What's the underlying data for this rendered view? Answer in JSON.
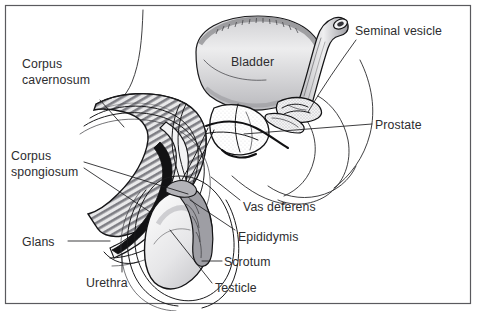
{
  "figure": {
    "type": "anatomical-illustration",
    "background_color": "#ffffff",
    "ink_color": "#1a1a1c",
    "frame_color": "#5a5a5e",
    "label_color": "#2d2d2f"
  },
  "labels": [
    {
      "id": "corpus-cavernosum",
      "line1": "Corpus",
      "line2": "cavernosum",
      "x": 22,
      "y": 68,
      "align": "start",
      "leader": "M100,100 L124,127"
    },
    {
      "id": "corpus-spongiosum",
      "line1": "Corpus",
      "line2": "spongiosum",
      "x": 11,
      "y": 150,
      "align": "start",
      "leader": "M84,164 L186,196"
    },
    {
      "id": "glans",
      "line1": "Glans",
      "line2": "",
      "x": 22,
      "y": 236,
      "align": "start",
      "leader": "M68,241 L108,241"
    },
    {
      "id": "urethra",
      "line1": "Urethra",
      "line2": "",
      "x": 86,
      "y": 276,
      "align": "start",
      "leader": "M122,272 L122,256"
    },
    {
      "id": "bladder",
      "line1": "Bladder",
      "line2": "",
      "x": 231,
      "y": 57,
      "align": "start",
      "leader": ""
    },
    {
      "id": "seminal-vesicle",
      "line1": "Seminal vesicle",
      "line2": "",
      "x": 355,
      "y": 25,
      "align": "start",
      "leader": "M356,40 L308,110"
    },
    {
      "id": "prostate",
      "line1": "Prostate",
      "line2": "",
      "x": 375,
      "y": 118,
      "align": "start",
      "leader": "M372,124 L244,133"
    },
    {
      "id": "vas-deferens",
      "line1": "Vas deferens",
      "line2": "",
      "x": 243,
      "y": 201,
      "align": "start",
      "leader": "M240,200 L211,177"
    },
    {
      "id": "epididymis",
      "line1": "Epididymis",
      "line2": "",
      "x": 238,
      "y": 231,
      "align": "start",
      "leader": "M235,230 L186,198"
    },
    {
      "id": "scrotum",
      "line1": "Scrotum",
      "line2": "",
      "x": 224,
      "y": 256,
      "align": "start",
      "leader": "M222,261 L204,261"
    },
    {
      "id": "testicle",
      "line1": "Testicle",
      "line2": "",
      "x": 215,
      "y": 282,
      "align": "start",
      "leader": "M213,283 L170,230"
    }
  ]
}
